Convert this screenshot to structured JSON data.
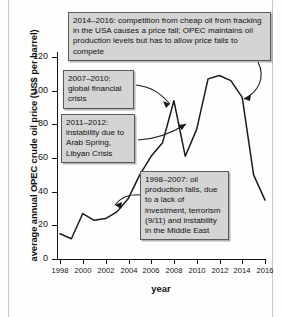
{
  "chart_data": {
    "type": "line",
    "title": "",
    "xlabel": "year",
    "ylabel": "average annual OPEC crude oil price (US$ per barrel)",
    "xlim": [
      1998,
      2016
    ],
    "ylim": [
      0,
      120
    ],
    "grid": false,
    "legend": "none",
    "x": [
      1998,
      1999,
      2000,
      2001,
      2002,
      2003,
      2004,
      2005,
      2006,
      2007,
      2008,
      2009,
      2010,
      2011,
      2012,
      2013,
      2014,
      2015,
      2016
    ],
    "values": [
      15,
      12,
      27,
      23,
      24,
      28,
      36,
      50,
      61,
      69,
      94,
      61,
      77,
      107,
      109,
      106,
      96,
      50,
      35
    ],
    "series": [
      {
        "name": "average annual OPEC crude oil price",
        "values": [
          15,
          12,
          27,
          23,
          24,
          28,
          36,
          50,
          61,
          69,
          94,
          61,
          77,
          107,
          109,
          106,
          96,
          50,
          35
        ]
      }
    ],
    "yticks": [
      0,
      20,
      40,
      60,
      80,
      100,
      120
    ],
    "xticks": [
      1998,
      2000,
      2002,
      2004,
      2006,
      2008,
      2010,
      2012,
      2014,
      2016
    ],
    "annotations": [
      "2014–2016: competition from cheap oil from fracking in the USA causes a price fall; OPEC maintains oil production levels but has to allow price falls to compete",
      "2007–2010: global financial crisis",
      "2011–2012: instability due to Arab Spring, Libyan Crisis",
      "1998–2007: oil production falls, due to a lack of investment, terrorism (9/11) and instability in the Middle East"
    ]
  },
  "axes": {
    "y_title": "average annual OPEC crude oil price (US$ per barrel)",
    "x_title": "year",
    "y_tick_labels": [
      "120",
      "100",
      "80",
      "60",
      "40",
      "20",
      "0"
    ],
    "x_tick_labels": [
      "1998",
      "2000",
      "2002",
      "2004",
      "2006",
      "2008",
      "2010",
      "2012",
      "2014",
      "2016"
    ]
  },
  "notes": {
    "fracking": "2014–2016: competition from cheap oil from fracking in the USA causes a price fall; OPEC maintains oil production levels but has to allow price falls to compete",
    "financial": "2007–2010: global financial crisis",
    "arabspring": "2011–2012: instability due to Arab Spring, Libyan Crisis",
    "production": "1998–2007: oil production falls, due to a lack of investment, terrorism (9/11) and instability in the Middle East"
  },
  "colors": {
    "line": "#1a1a1a",
    "note_fill": "#d4d4d4",
    "note_border": "#5a5a5a",
    "axis": "#111111"
  }
}
